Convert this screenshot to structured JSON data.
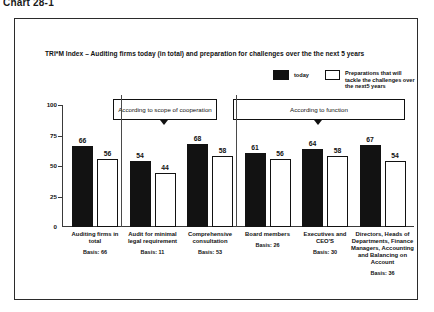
{
  "page_heading": "Chart 28-1",
  "chart": {
    "title": "TRI*M Index – Auditing firms today (in total) and preparation for challenges over the the next 5 years",
    "legend": {
      "today_label": "today",
      "future_label": "Preparations that will tackle the challenges over the next5 years",
      "today_color": "#121212",
      "future_color": "#ffffff"
    },
    "group_boxes": [
      {
        "name": "scope",
        "label": "According to scope of cooperation"
      },
      {
        "name": "function",
        "label": "According to function"
      }
    ]
  },
  "chart_data": {
    "type": "bar",
    "title": "TRI*M Index – Auditing firms today (in total) and preparation for challenges over the the next 5 years",
    "xlabel": "",
    "ylabel": "",
    "ylim": [
      0,
      100
    ],
    "yticks": [
      "0",
      "25",
      "50",
      "75",
      "100"
    ],
    "grid": false,
    "legend_position": "top-right",
    "categories": [
      "Auditing firms in total",
      "Audit for minimal legal requirement",
      "Comprehensive consultation",
      "Board members",
      "Executives and CEO'S",
      "Directors, Heads of Departments, Finance Managers, Accounting and Balancing on Account"
    ],
    "basis_labels": [
      "Basis: 66",
      "Basis: 11",
      "Basis: 53",
      "Basis: 26",
      "Basis: 30",
      "Basis: 36"
    ],
    "series": [
      {
        "name": "today",
        "values": [
          66,
          54,
          68,
          61,
          64,
          67
        ]
      },
      {
        "name": "Preparations that will tackle the challenges over the next5 years",
        "values": [
          56,
          44,
          58,
          56,
          58,
          54
        ]
      }
    ]
  }
}
